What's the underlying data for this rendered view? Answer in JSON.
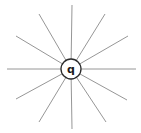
{
  "diagram": {
    "title": "",
    "type": "radial-field-lines",
    "charge": {
      "label": "q",
      "center": [
        71,
        69
      ],
      "radius": 10
    },
    "field_lines": {
      "count": 12,
      "angle_step_deg": 30,
      "color": "#8a8a8a",
      "endpoints": [
        [
          136,
          69
        ],
        [
          127,
          100
        ],
        [
          106,
          122
        ],
        [
          72,
          129
        ],
        [
          39,
          122
        ],
        [
          16,
          99
        ],
        [
          7,
          69
        ],
        [
          16,
          36
        ],
        [
          39,
          14
        ],
        [
          72,
          5
        ],
        [
          105,
          14
        ],
        [
          128,
          36
        ]
      ]
    },
    "colors": {
      "background": "#ffffff",
      "circle_stroke": "#2a2a2a",
      "label": "#1a1a1a"
    }
  }
}
